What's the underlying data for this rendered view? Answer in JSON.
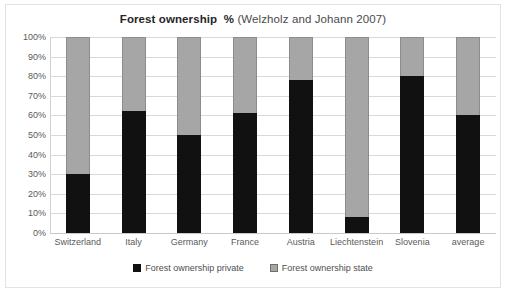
{
  "chart_data": {
    "type": "bar",
    "stacked": true,
    "title": "Forest ownership  % (Welzholz and Johann 2007)",
    "title_strong": "Forest ownership  %",
    "title_light": " (Welzholz and Johann 2007)",
    "xlabel": "",
    "ylabel": "",
    "ylim": [
      0,
      100
    ],
    "grid": true,
    "legend_position": "bottom",
    "categories": [
      "Switzerland",
      "Italy",
      "Germany",
      "France",
      "Austria",
      "Liechtenstein",
      "Slovenia",
      "average"
    ],
    "ytick_labels": [
      "100%",
      "90%",
      "80%",
      "70%",
      "60%",
      "50%",
      "40%",
      "30%",
      "20%",
      "10%",
      "0%"
    ],
    "ytick_values": [
      100,
      90,
      80,
      70,
      60,
      50,
      40,
      30,
      20,
      10,
      0
    ],
    "series": [
      {
        "name": "Forest ownership private",
        "color": "#111111",
        "values": [
          30,
          62,
          50,
          61,
          78,
          8,
          80,
          60
        ]
      },
      {
        "name": "Forest ownership state",
        "color": "#a6a6a6",
        "values": [
          70,
          38,
          50,
          39,
          22,
          92,
          20,
          40
        ]
      }
    ]
  },
  "legend": {
    "items": [
      {
        "label": "Forest ownership private",
        "marker": "black-square-icon"
      },
      {
        "label": "Forest ownership state",
        "marker": "gray-square-icon"
      }
    ]
  }
}
